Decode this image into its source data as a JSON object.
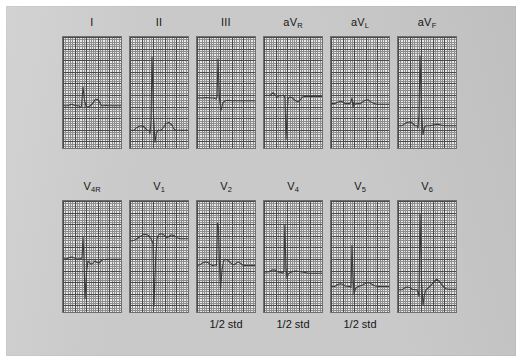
{
  "figure": {
    "kind": "12-lead-electrocardiogram",
    "background_color": "#c9c9c9",
    "paper_color": "#e8e8e8",
    "grid_major_color": "#4a4a4a",
    "grid_minor_color": "#8e8e8e",
    "trace_color": "#3a3a3a"
  },
  "rows": [
    {
      "name": "limb-leads",
      "panels": [
        {
          "id": "lead-I",
          "label_main": "I",
          "label_sub": "",
          "note": "",
          "baseline_pct": 62,
          "trace": "M0,62 L5,62 L7,61 L9,60.5 L11,61.5 L13,62 L16,62 L17.5,63.5 L18.5,62 L20,45 L21.5,57 L23,62.5 L25,63 L27,62.2 L29.5,60 L32,56.5 L34.5,56 L36.5,58.5 L38.5,62 L41,62 L43,61.5 L45,62 L58,62"
        },
        {
          "id": "lead-II",
          "label_main": "II",
          "label_sub": "",
          "note": "",
          "baseline_pct": 84,
          "trace": "M0,84 L4,84 L6,82 L9,80.5 L12,80 L14.5,81 L16,83 L17.5,84 L19,84 L20,87 L21,76 L22,18 L23.5,70 L25,95 L26.5,86 L28,84 L31,84 L33,82 L36,78 L39,77 L42,79.5 L44,83 L46,84 L58,84"
        },
        {
          "id": "lead-III",
          "label_main": "III",
          "label_sub": "",
          "note": "",
          "baseline_pct": 55,
          "trace": "M0,55 L6,55 L9,54.5 L13,55 L17,55 L19,56 L20,54 L21,20 L22.5,56 L24,66 L26,59 L28,57.5 L31,57 L35,57.5 L40,57.5 L45,57.5 L58,57.5"
        },
        {
          "id": "lead-aVR",
          "label_main": "aV",
          "label_sub": "R",
          "note": "",
          "baseline_pct": 53,
          "trace": "M0,53 L3,52.5 L5,53 L7,52 L9,50 L11,52 L13,54.5 L15,53 L17,53 L19,52.5 L20,53 L21,55 L22,92 L23,72 L24,56 L25.5,54 L28,54.5 L31,57 L33.5,58.5 L36,57 L38.5,54 L41,53.5 L45,53.5 L58,53.5"
        },
        {
          "id": "lead-aVL",
          "label_main": "aV",
          "label_sub": "L",
          "note": "",
          "baseline_pct": 60,
          "trace": "M0,60 L4,60 L6,59 L9,58 L12,58.5 L14,60 L17,60 L19,60 L20,58 L21,55 L22,63 L23,58.5 L24,60.5 L26,60 L29,60 L31,59 L34,57 L37,56.5 L40,58.5 L43,60 L46,60.5 L58,60.5"
        },
        {
          "id": "lead-aVF",
          "label_main": "aV",
          "label_sub": "F",
          "note": "",
          "baseline_pct": 80,
          "trace": "M0,80 L4,80 L6,78.5 L9,77 L12,76.5 L15,78 L17,80 L19,80 L20,82 L21,70 L22,17 L23.5,66 L25,88 L26.5,81 L28,80 L32,80 L36,79 L40,78.5 L44,79.5 L48,80 L58,80"
        }
      ]
    },
    {
      "name": "precordial-leads",
      "panels": [
        {
          "id": "lead-V4R",
          "label_main": "V",
          "label_sub": "4R",
          "note": "",
          "baseline_pct": 52,
          "trace": "M0,52 L4,52 L6,51 L9,50.5 L12,51.5 L14,52.5 L16,52 L18,52 L19,51 L20,33 L21,52 L22,88 L23.5,64 L25,54 L26.5,55.5 L28,57 L30,56 L32,54 L34,55.5 L36,56 L38,54 L40,52.5 L42,53 L44,52.5 L58,52.5"
        },
        {
          "id": "lead-V1",
          "label_main": "V",
          "label_sub": "1",
          "note": "",
          "baseline_pct": 34,
          "trace": "M0,36 L4,35.5 L7,34 L10,32 L13,30.5 L16,30 L18.5,31 L20,33 L21,34 L22,36 L23,38 L24,95 L25.5,55 L27,34 L28.5,30.5 L30.5,29.5 L33,30 L35,31.5 L37,33 L39,32 L41,30.5 L44,31 L47,33 L50,34 L58,34"
        },
        {
          "id": "lead-V2",
          "label_main": "V",
          "label_sub": "2",
          "note": "1/2 std",
          "baseline_pct": 56,
          "trace": "M0,58 L3,57.5 L5,56 L8,55 L11,55.5 L13,57 L15,58 L17,58 L18.5,57.5 L19.5,58 L20.5,20 L21.5,24 L22.5,58 L23.5,80 L25,62 L26.5,54 L28,52.5 L30,53 L32,54.5 L34,56 L36,57.5 L38,57 L40,55.5 L42,55 L44,56.5 L46,58 L48,58 L58,58"
        },
        {
          "id": "lead-V4",
          "label_main": "V",
          "label_sub": "4",
          "note": "1/2 std",
          "baseline_pct": 64,
          "trace": "M0,64 L4,64 L6,63 L9,62 L12,62.5 L14,64 L17,64.5 L19,65 L20,63 L20.8,22 L22,60 L23,70 L24,66 L26,64.5 L29,63.5 L32,63 L35,63.5 L38,64 L41,64.5 L44,65 L47,65 L58,65"
        },
        {
          "id": "lead-V5",
          "label_main": "V",
          "label_sub": "5",
          "note": "1/2 std",
          "baseline_pct": 76,
          "trace": "M0,77 L4,77 L6,75.5 L9,74.5 L12,75 L14,76.5 L17,77 L19,77 L20,78 L21,40 L22,68 L23,84 L24.5,79 L26,77.5 L29,76.5 L32,75.5 L35,74 L38,73.5 L41,75 L44,76.5 L47,77 L58,77"
        },
        {
          "id": "lead-V6",
          "label_main": "V",
          "label_sub": "6",
          "note": "",
          "baseline_pct": 79,
          "trace": "M0,80 L4,80 L6,78.5 L9,77.5 L12,78 L14,79.5 L17,80 L19,80 L20,82 L21,86 L22,12 L23.5,70 L25,94 L26.5,84 L28,80 L30,78.5 L33,76 L36,72.5 L39,70.5 L42,73 L45,77 L48,79 L51,79.5 L58,79.5"
        }
      ]
    }
  ],
  "geometry": {
    "panel_width": 58,
    "panel_height": 111,
    "panel_gap": 9,
    "first_panel_left": 63,
    "row1_top": 37,
    "row2_top": 201,
    "row1_label_top": 16,
    "row2_label_top": 180,
    "note_top": 318
  }
}
